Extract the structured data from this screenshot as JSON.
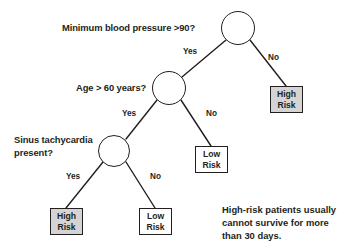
{
  "diagram": {
    "type": "decision-tree",
    "background_color": "#ffffff",
    "stroke_color": "#231f20",
    "high_risk_fill": "#d4d4d4",
    "low_risk_fill": "#ffffff"
  },
  "nodes": {
    "root": {
      "question": "Minimum blood pressure >90?",
      "cx": 238,
      "cy": 28,
      "r": 17
    },
    "age": {
      "question": "Age > 60 years?",
      "cx": 169,
      "cy": 88,
      "r": 17
    },
    "sinus": {
      "question_line1": "Sinus tachycardia",
      "question_line2": "present?",
      "cx": 114,
      "cy": 151,
      "r": 16
    }
  },
  "edges": [
    {
      "from": "root",
      "to": "age",
      "label": "Yes"
    },
    {
      "from": "root",
      "to": "leaf_high_right",
      "label": "No"
    },
    {
      "from": "age",
      "to": "sinus",
      "label": "Yes"
    },
    {
      "from": "age",
      "to": "leaf_low_middle",
      "label": "No"
    },
    {
      "from": "sinus",
      "to": "leaf_high_bottom",
      "label": "Yes"
    },
    {
      "from": "sinus",
      "to": "leaf_low_bottom",
      "label": "No"
    }
  ],
  "edge_labels": {
    "root_yes": "Yes",
    "root_no": "No",
    "age_yes": "Yes",
    "age_no": "No",
    "sinus_yes": "Yes",
    "sinus_no": "No"
  },
  "leaves": {
    "high_right": {
      "line1": "High",
      "line2": "Risk",
      "risk": "high"
    },
    "low_middle": {
      "line1": "Low",
      "line2": "Risk",
      "risk": "low"
    },
    "high_bottom": {
      "line1": "High",
      "line2": "Risk",
      "risk": "high"
    },
    "low_bottom": {
      "line1": "Low",
      "line2": "Risk",
      "risk": "low"
    }
  },
  "annotation": {
    "line1": "High-risk patients usually",
    "line2": "cannot survive for more",
    "line3": "than 30 days."
  }
}
